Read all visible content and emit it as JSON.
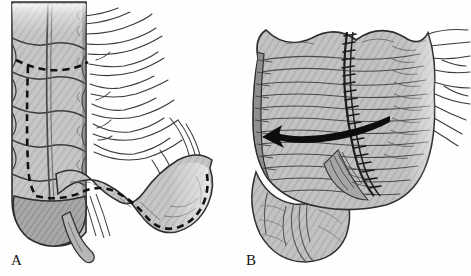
{
  "figure": {
    "type": "medical-surgical-illustration",
    "background_color": "#fefefe",
    "width": 471,
    "height": 276,
    "panel_count": 2
  },
  "panels": [
    {
      "id": "A",
      "label": "A",
      "label_position": {
        "x": 11,
        "y": 252
      },
      "description": "Right colon and cecum with haustral segments, mesentery, appendix and terminal ileum; bold dashed line marks the planned line of incision / resection",
      "structures": [
        {
          "name": "ascending-colon",
          "note": "haustrated segmented bowel, vertical, left side of panel, cut off at top edge"
        },
        {
          "name": "taenia-coli",
          "note": "longitudinal muscle band running down the colon"
        },
        {
          "name": "haustra",
          "count": 6,
          "note": "rounded sacculations separated by transverse folds"
        },
        {
          "name": "mesentery",
          "note": "fan of radiating vessel lines to the right of the bowel"
        },
        {
          "name": "cecum",
          "note": "bulbous pouch at the inferior end of the colon"
        },
        {
          "name": "appendix",
          "note": "narrow tubular structure descending from the cecum"
        },
        {
          "name": "terminal-ileum",
          "note": "curved loop of small bowel sweeping to the right, fading at the right image edge"
        },
        {
          "name": "incision-line",
          "note": "heavy black dashed line, starts transversely across the colon near the top, turns and runs vertically down the colon, then curves along the ileum to the right edge"
        }
      ],
      "annotations": [
        {
          "name": "dashed-incision-line",
          "style": "dashed",
          "color": "#111111",
          "stroke_width": 2.6
        }
      ]
    },
    {
      "id": "B",
      "label": "B",
      "label_position": {
        "x": 246,
        "y": 252
      },
      "description": "Completed reconstruction: bowel opened and closed with a running suture line; bold curved arrow indicates the direction of detorsion / reduction",
      "structures": [
        {
          "name": "reconstructed-colon",
          "note": "broad rounded bowel mass occupying most of the panel"
        },
        {
          "name": "suture-line",
          "note": "vertical chain of closely spaced stitch marks running from the top margin down to the inferior fold"
        },
        {
          "name": "serosal-striations",
          "note": "fine curved hatch lines describing the bowel surface"
        },
        {
          "name": "cut-edge-band",
          "note": "darker hatched vertical band along the left margin"
        },
        {
          "name": "cecal-pouch",
          "note": "rounded sac at the lower left with converging fold lines"
        },
        {
          "name": "mesentery",
          "note": "fan of vessel lines extending off the right margin"
        }
      ],
      "annotations": [
        {
          "name": "direction-arrow",
          "style": "solid-tapered-curve",
          "color": "#0d0d0d",
          "points": "left",
          "note": "bold curved arrow sweeping right-to-left across the mid bowel"
        },
        {
          "name": "suture-line",
          "style": "running-stitch",
          "color": "#1a1a1a"
        }
      ]
    }
  ],
  "palette": {
    "background": "#fefefe",
    "bowel_fill_light": "#cfcfcf",
    "bowel_fill_mid": "#b4b4b4",
    "bowel_fill_dark": "#9a9a9a",
    "bowel_shadow": "#8a8a8a",
    "outline": "#2b2b2b",
    "ink": "#111111",
    "label_color": "#151515"
  }
}
